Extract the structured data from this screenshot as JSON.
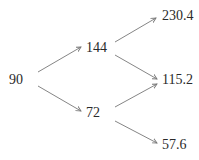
{
  "tree": {
    "type": "binomial-tree",
    "levels": 3,
    "nodes": {
      "root": {
        "label": "90"
      },
      "up": {
        "label": "144"
      },
      "down": {
        "label": "72"
      },
      "up_up": {
        "label": "230.4"
      },
      "mid": {
        "label": "115.2"
      },
      "down_down": {
        "label": "57.6"
      }
    },
    "edges": [
      {
        "from": "root",
        "to": "up"
      },
      {
        "from": "root",
        "to": "down"
      },
      {
        "from": "up",
        "to": "up_up"
      },
      {
        "from": "up",
        "to": "mid"
      },
      {
        "from": "down",
        "to": "mid"
      },
      {
        "from": "down",
        "to": "down_down"
      }
    ],
    "colors": {
      "text": "#2a2a2a",
      "arrow": "#777777",
      "background": "#ffffff"
    }
  }
}
